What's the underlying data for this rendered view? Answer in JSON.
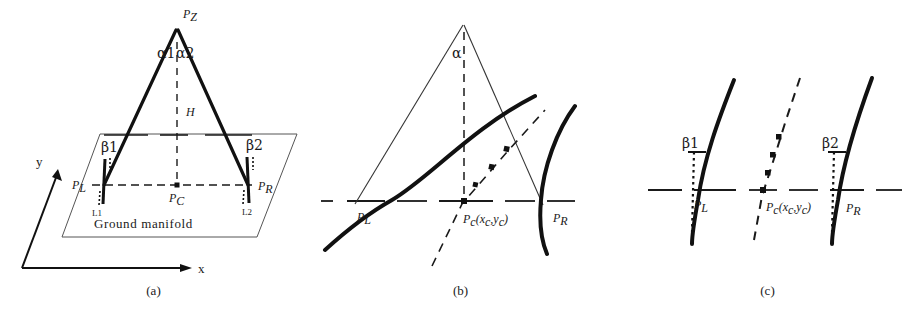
{
  "figure": {
    "panels": [
      {
        "id": "a",
        "caption": "(a)",
        "labels": {
          "apex": "P",
          "apex_sub": "Z",
          "alpha1": "α1",
          "alpha2": "α2",
          "height": "H",
          "beta1": "β1",
          "beta2": "β2",
          "p_left": "P",
          "p_left_sub": "L",
          "p_right": "P",
          "p_right_sub": "R",
          "p_center": "P",
          "p_center_sub": "C",
          "line1": "L1",
          "line2": "L2",
          "ground": "Ground manifold",
          "axis_x": "x",
          "axis_y": "y"
        }
      },
      {
        "id": "b",
        "caption": "(b)",
        "labels": {
          "alpha": "α",
          "p_left": "P",
          "p_left_sub": "L",
          "p_right": "P",
          "p_right_sub": "R",
          "p_center": "P",
          "p_center_sub": "c",
          "p_center_coords_open": "(x",
          "p_center_coords_xsub": "c",
          "p_center_coords_comma": ",y",
          "p_center_coords_ysub": "c",
          "p_center_coords_close": ")"
        }
      },
      {
        "id": "c",
        "caption": "(c)",
        "labels": {
          "beta1": "β1",
          "beta2": "β2",
          "p_left": "P",
          "p_left_sub": "L",
          "p_right": "P",
          "p_right_sub": "R",
          "p_center": "P",
          "p_center_sub": "c",
          "p_center_coords_open": "(x",
          "p_center_coords_xsub": "c",
          "p_center_coords_comma": ",y",
          "p_center_coords_ysub": "c",
          "p_center_coords_close": ")"
        }
      }
    ]
  },
  "colors": {
    "ink": "#1a1a1a",
    "thin": "#333333",
    "background": "#ffffff"
  }
}
